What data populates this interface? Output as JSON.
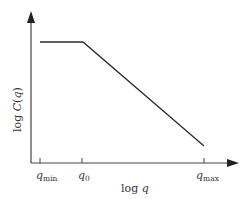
{
  "diagram": {
    "type": "log-log schematic",
    "y_axis_label_prefix": "log ",
    "y_axis_label_func": "C",
    "y_axis_label_var": "(q)",
    "y_axis_label_open": "(",
    "y_axis_label_q": "q",
    "y_axis_label_close": ")",
    "x_axis_label_prefix": "log ",
    "x_axis_label_var": "q",
    "ticks": [
      {
        "base": "q",
        "sub": "min"
      },
      {
        "base": "q",
        "sub": "0"
      },
      {
        "base": "q",
        "sub": "max"
      }
    ],
    "curve": {
      "description": "flat plateau from q_min to q_0, then linear decrease to q_max",
      "color": "#2a2a2a"
    },
    "axis_color": "#333333"
  }
}
